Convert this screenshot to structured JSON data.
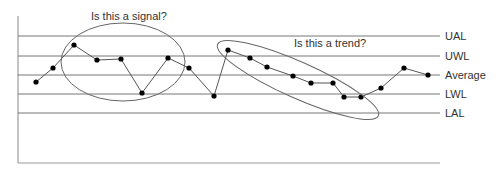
{
  "chart_data": {
    "type": "line",
    "title": "",
    "xlabel": "",
    "ylabel": "",
    "grid": false,
    "control_lines": [
      {
        "name": "UAL",
        "y_px": 36
      },
      {
        "name": "UWL",
        "y_px": 56
      },
      {
        "name": "Average",
        "y_px": 75
      },
      {
        "name": "LWL",
        "y_px": 94
      },
      {
        "name": "LAL",
        "y_px": 113
      }
    ],
    "series": [
      {
        "name": "measurements",
        "points_px": [
          [
            36,
            82
          ],
          [
            53,
            68
          ],
          [
            74,
            45
          ],
          [
            97,
            60
          ],
          [
            121,
            59
          ],
          [
            142,
            93
          ],
          [
            168,
            58
          ],
          [
            189,
            68
          ],
          [
            214,
            96
          ],
          [
            228,
            50
          ],
          [
            250,
            58
          ],
          [
            267,
            67
          ],
          [
            293,
            76
          ],
          [
            311,
            83
          ],
          [
            333,
            83
          ],
          [
            344,
            97
          ],
          [
            361,
            97
          ],
          [
            381,
            88
          ],
          [
            404,
            68
          ],
          [
            428,
            75
          ]
        ]
      }
    ],
    "annotations": [
      {
        "text": "Is this a signal?",
        "shape": "ellipse",
        "cx": 123,
        "cy": 62,
        "rx": 62,
        "ry": 39,
        "rotate": 0,
        "text_x": 91,
        "text_y": 20
      },
      {
        "text": "Is this a trend?",
        "shape": "ellipse",
        "cx": 298,
        "cy": 80,
        "rx": 88,
        "ry": 18,
        "rotate": 24,
        "text_x": 294,
        "text_y": 47
      }
    ]
  },
  "labels": {
    "ual": "UAL",
    "uwl": "UWL",
    "average": "Average",
    "lwl": "LWL",
    "lal": "LAL",
    "signal_question": "Is this a signal?",
    "trend_question": "Is this a trend?"
  },
  "colors": {
    "line": "#555555",
    "axis": "#888888",
    "point": "#000000",
    "text": "#333333"
  }
}
